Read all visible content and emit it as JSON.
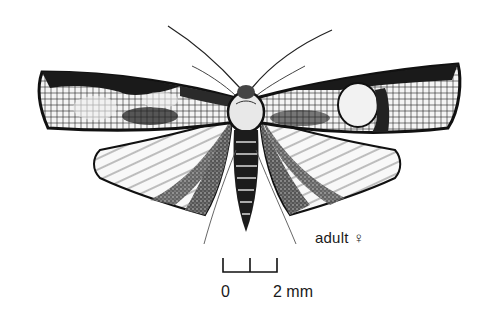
{
  "figure": {
    "label": "adult ♀",
    "scale_bar": {
      "start_label": "0",
      "end_label": "2 mm"
    },
    "colors": {
      "ink": "#111111",
      "paper": "#ffffff",
      "mid_tone": "#8a8a8a"
    }
  }
}
